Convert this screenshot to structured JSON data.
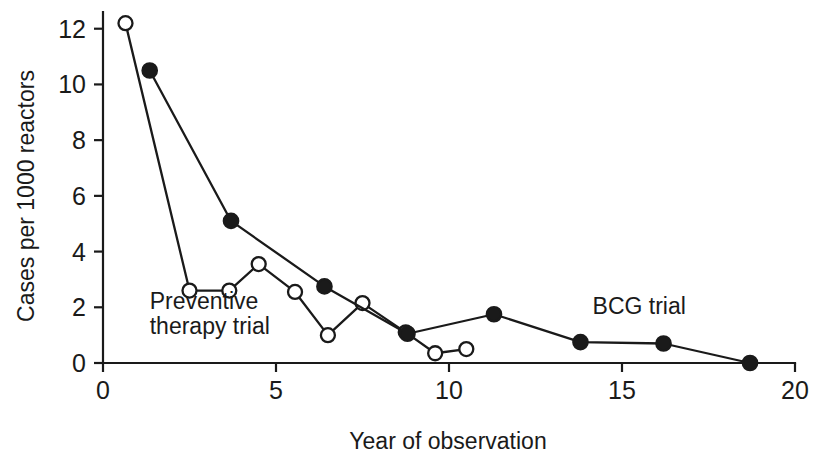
{
  "chart_data": {
    "type": "line",
    "title": "",
    "xlabel": "Year of observation",
    "ylabel": "Cases per 1000 reactors",
    "xlim": [
      0,
      20
    ],
    "ylim": [
      0,
      12.6
    ],
    "xticks": [
      0,
      5,
      10,
      15,
      20
    ],
    "xtick_labels": [
      "0",
      "5",
      "10",
      "15",
      "20"
    ],
    "yticks": [
      0,
      2,
      4,
      6,
      8,
      10,
      12
    ],
    "ytick_labels": [
      "0",
      "2",
      "4",
      "6",
      "8",
      "10",
      "12"
    ],
    "grid": false,
    "legend": "inline-annotations",
    "series": [
      {
        "name": "Preventive therapy trial",
        "marker": "open-circle",
        "x": [
          0.65,
          2.5,
          3.65,
          4.5,
          5.55,
          6.5,
          7.5,
          8.75,
          9.6,
          10.5
        ],
        "y": [
          12.2,
          2.6,
          2.6,
          3.55,
          2.55,
          1.0,
          2.15,
          1.1,
          0.35,
          0.5
        ]
      },
      {
        "name": "BCG trial",
        "marker": "filled-circle",
        "x": [
          1.35,
          3.7,
          6.4,
          8.8,
          11.3,
          13.8,
          16.2,
          18.7
        ],
        "y": [
          10.5,
          5.1,
          2.75,
          1.05,
          1.75,
          0.75,
          0.7,
          0.0
        ]
      }
    ],
    "annotations": [
      {
        "text": "Preventive",
        "x": 1.35,
        "y": 1.95
      },
      {
        "text": "therapy trial",
        "x": 1.35,
        "y": 1.05
      },
      {
        "text": "BCG trial",
        "x": 14.15,
        "y": 1.75
      }
    ]
  },
  "axes": {
    "x_axis_label": "Year of observation",
    "y_axis_label": "Cases per 1000 reactors"
  },
  "annotation_labels": {
    "preventive_line1": "Preventive",
    "preventive_line2": "therapy trial",
    "bcg": "BCG trial"
  },
  "colors": {
    "ink": "#1a1a1a",
    "background": "#ffffff"
  }
}
